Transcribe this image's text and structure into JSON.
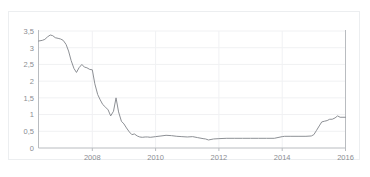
{
  "chart_data": {
    "type": "line",
    "title": "",
    "xlabel": "",
    "ylabel": "",
    "xlim": [
      2006.3,
      2016.0
    ],
    "ylim": [
      0,
      3.5
    ],
    "grid": true,
    "legend": "none",
    "line_color": "#8d9095",
    "axis_color": "#b9bcc0",
    "grid_color": "#f0f1f3",
    "tick_text_color": "#8a8d92",
    "decimal_separator": ",",
    "ytick_labels": [
      "3,5",
      "3",
      "2,5",
      "2",
      "1,5",
      "1",
      "0,5",
      "0"
    ],
    "ytick_values": [
      3.5,
      3,
      2.5,
      2,
      1.5,
      1,
      0.5,
      0
    ],
    "xtick_labels": [
      "2008",
      "2010",
      "2012",
      "2014",
      "2016"
    ],
    "xtick_values": [
      2008,
      2010,
      2012,
      2014,
      2016
    ],
    "series": [
      {
        "name": "rate",
        "x": [
          2006.3,
          2006.42,
          2006.5,
          2006.58,
          2006.67,
          2006.75,
          2006.83,
          2006.92,
          2007.0,
          2007.08,
          2007.17,
          2007.25,
          2007.33,
          2007.42,
          2007.5,
          2007.58,
          2007.67,
          2007.75,
          2007.83,
          2007.92,
          2008.0,
          2008.08,
          2008.17,
          2008.25,
          2008.33,
          2008.42,
          2008.5,
          2008.58,
          2008.67,
          2008.75,
          2008.83,
          2008.92,
          2009.0,
          2009.08,
          2009.17,
          2009.25,
          2009.33,
          2009.42,
          2009.5,
          2009.58,
          2009.67,
          2009.75,
          2009.83,
          2009.92,
          2010.0,
          2010.17,
          2010.33,
          2010.5,
          2010.67,
          2010.83,
          2011.0,
          2011.17,
          2011.33,
          2011.5,
          2011.58,
          2011.67,
          2011.83,
          2012.0,
          2012.25,
          2012.5,
          2012.75,
          2013.0,
          2013.25,
          2013.5,
          2013.75,
          2014.0,
          2014.08,
          2014.25,
          2014.5,
          2014.75,
          2014.92,
          2015.0,
          2015.08,
          2015.17,
          2015.25,
          2015.33,
          2015.42,
          2015.5,
          2015.58,
          2015.67,
          2015.75,
          2015.83,
          2015.92,
          2016.0
        ],
        "y": [
          3.2,
          3.22,
          3.25,
          3.32,
          3.38,
          3.36,
          3.3,
          3.28,
          3.26,
          3.22,
          3.1,
          2.9,
          2.62,
          2.38,
          2.26,
          2.4,
          2.5,
          2.42,
          2.4,
          2.35,
          2.34,
          1.92,
          1.6,
          1.44,
          1.3,
          1.22,
          1.14,
          0.96,
          1.1,
          1.5,
          1.08,
          0.8,
          0.72,
          0.6,
          0.48,
          0.4,
          0.42,
          0.36,
          0.33,
          0.32,
          0.33,
          0.33,
          0.32,
          0.33,
          0.34,
          0.36,
          0.38,
          0.37,
          0.35,
          0.34,
          0.33,
          0.34,
          0.31,
          0.28,
          0.27,
          0.24,
          0.27,
          0.28,
          0.29,
          0.29,
          0.29,
          0.29,
          0.29,
          0.29,
          0.29,
          0.34,
          0.35,
          0.35,
          0.35,
          0.35,
          0.36,
          0.4,
          0.52,
          0.66,
          0.78,
          0.8,
          0.82,
          0.86,
          0.86,
          0.9,
          0.96,
          0.92,
          0.92,
          0.92
        ]
      }
    ]
  },
  "panel": {
    "border_color": "#eceef0"
  }
}
